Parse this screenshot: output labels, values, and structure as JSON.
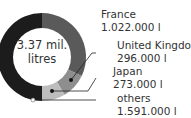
{
  "chart_data": {
    "type": "pie",
    "subtype": "donut",
    "center_label": [
      "3.37 mil.",
      "litres"
    ],
    "total_label": "3.37 mil. litres",
    "categories": [
      "France",
      "United Kingdom",
      "Japan",
      "others"
    ],
    "values": [
      1022000,
      296000,
      273000,
      1591000
    ],
    "value_labels": [
      "1.022.000 l",
      "296.000 l",
      "273.000 l",
      "1.591.000 l"
    ],
    "colors": [
      "#5a5a5a",
      "#8e8e8e",
      "#bdbdbd",
      "#1c1c1c"
    ],
    "unit": "l",
    "legend": "callout labels on right"
  },
  "center": {
    "line1": "3.37 mil.",
    "line2": "litres"
  },
  "labels": [
    {
      "name": "France",
      "value": "1.022.000 l"
    },
    {
      "name": "United Kingdom",
      "value": "296.000 l"
    },
    {
      "name": "Japan",
      "value": "273.000 l"
    },
    {
      "name": "others",
      "value": "1.591.000 l"
    }
  ]
}
